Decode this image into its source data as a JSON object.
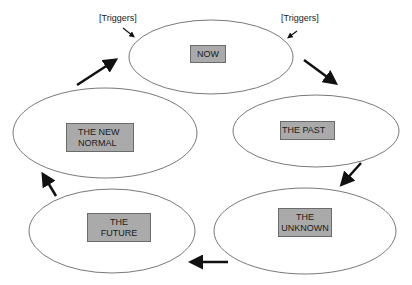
{
  "nodes": [
    {
      "id": "now",
      "label": "NOW"
    },
    {
      "id": "past",
      "label": "THE PAST"
    },
    {
      "id": "unknown",
      "label_line1": "THE",
      "label_line2": "UNKNOWN"
    },
    {
      "id": "future",
      "label_line1": "THE",
      "label_line2": "FUTURE"
    },
    {
      "id": "new_normal",
      "label_line1": "THE NEW",
      "label_line2": "NORMAL"
    }
  ],
  "triggers": [
    {
      "label": "[Triggers]"
    },
    {
      "label": "[Triggers]"
    }
  ],
  "edges": [
    {
      "from": "now",
      "to": "past"
    },
    {
      "from": "past",
      "to": "unknown"
    },
    {
      "from": "unknown",
      "to": "future"
    },
    {
      "from": "future",
      "to": "new_normal"
    },
    {
      "from": "new_normal",
      "to": "now"
    }
  ],
  "colors": {
    "box_fill": "#aaaaaa",
    "box_border": "#6b6b6b",
    "ellipse_stroke": "#555555",
    "arrow": "#111111"
  }
}
